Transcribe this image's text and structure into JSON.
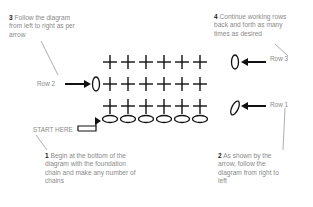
{
  "diagram": {
    "notes": [
      {
        "number": "1",
        "text": "Begin at the bottom of the diagram with the foundation chain and make any number of chains"
      },
      {
        "number": "2",
        "text": "As shown by the arrow, follow the diagram from right to left"
      },
      {
        "number": "3",
        "text": "Follow the diagram from left to right as per arrow"
      },
      {
        "number": "4",
        "text": "Continue working rows back and forth as many times as desired"
      }
    ],
    "labels": {
      "start": "START HERE",
      "row1": "Row 1",
      "row2": "Row 2",
      "row3": "Row 3"
    },
    "stitches": {
      "foundation_chain_count": 6,
      "rows": 3,
      "stitches_per_row": 6,
      "stitch_symbol": "single-crochet-cross",
      "chain_symbol": "oval"
    },
    "colors": {
      "symbols": "#111111",
      "text": "#8a8a8a",
      "number": "#222222"
    }
  }
}
